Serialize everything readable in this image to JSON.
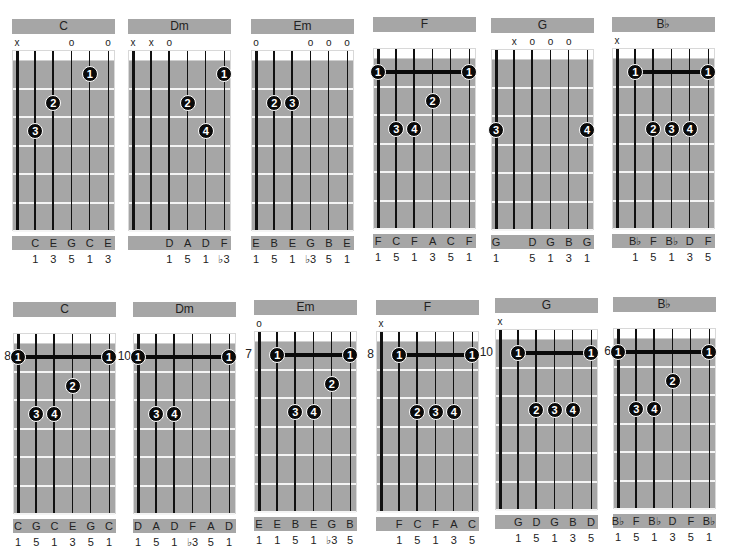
{
  "colors": {
    "panel": "#a6a6a6",
    "dot": "#0a0a0a",
    "fret": "#f4f4f4",
    "nut": "#ffffff"
  },
  "rows": [
    {
      "charts": [
        {
          "name": "C",
          "x": 12,
          "y": 19,
          "start_fret": null,
          "markers": [
            "x",
            "",
            "",
            "o",
            "",
            "o"
          ],
          "dots": [
            {
              "string": 4,
              "fret": 1,
              "finger": "1"
            },
            {
              "string": 2,
              "fret": 2,
              "finger": "2"
            },
            {
              "string": 1,
              "fret": 3,
              "finger": "3"
            }
          ],
          "barre": null,
          "notes": [
            "",
            "C",
            "E",
            "G",
            "C",
            "E"
          ],
          "intervals": [
            "",
            "1",
            "3",
            "5",
            "1",
            "3"
          ]
        },
        {
          "name": "Dm",
          "x": 128,
          "y": 19,
          "start_fret": null,
          "markers": [
            "x",
            "x",
            "o",
            "",
            "",
            ""
          ],
          "dots": [
            {
              "string": 5,
              "fret": 1,
              "finger": "1"
            },
            {
              "string": 3,
              "fret": 2,
              "finger": "2"
            },
            {
              "string": 4,
              "fret": 3,
              "finger": "4"
            }
          ],
          "barre": null,
          "notes": [
            "",
            "",
            "D",
            "A",
            "D",
            "F"
          ],
          "intervals": [
            "",
            "",
            "1",
            "5",
            "1",
            "♭3"
          ]
        },
        {
          "name": "Em",
          "x": 251,
          "y": 19,
          "start_fret": null,
          "markers": [
            "o",
            "",
            "",
            "o",
            "o",
            "o"
          ],
          "dots": [
            {
              "string": 1,
              "fret": 2,
              "finger": "2"
            },
            {
              "string": 2,
              "fret": 2,
              "finger": "3"
            }
          ],
          "barre": null,
          "notes": [
            "E",
            "B",
            "E",
            "G",
            "B",
            "E"
          ],
          "intervals": [
            "1",
            "5",
            "1",
            "♭3",
            "5",
            "1"
          ]
        },
        {
          "name": "F",
          "x": 373,
          "y": 17,
          "start_fret": null,
          "markers": [
            "",
            "",
            "",
            "",
            "",
            ""
          ],
          "dots": [
            {
              "string": 0,
              "fret": 1,
              "finger": "1"
            },
            {
              "string": 5,
              "fret": 1,
              "finger": "1"
            },
            {
              "string": 3,
              "fret": 2,
              "finger": "2"
            },
            {
              "string": 1,
              "fret": 3,
              "finger": "3"
            },
            {
              "string": 2,
              "fret": 3,
              "finger": "4"
            }
          ],
          "barre": {
            "from": 0,
            "to": 5,
            "fret": 1
          },
          "notes": [
            "F",
            "C",
            "F",
            "A",
            "C",
            "F"
          ],
          "intervals": [
            "1",
            "5",
            "1",
            "3",
            "5",
            "1"
          ]
        },
        {
          "name": "G",
          "x": 491,
          "y": 18,
          "start_fret": null,
          "markers": [
            "",
            "x",
            "o",
            "o",
            "o",
            ""
          ],
          "dots": [
            {
              "string": 0,
              "fret": 3,
              "finger": "3"
            },
            {
              "string": 5,
              "fret": 3,
              "finger": "4"
            }
          ],
          "barre": null,
          "notes": [
            "G",
            "",
            "D",
            "G",
            "B",
            "G"
          ],
          "intervals": [
            "1",
            "",
            "5",
            "1",
            "3",
            "1"
          ]
        },
        {
          "name": "B♭",
          "x": 612,
          "y": 17,
          "start_fret": null,
          "markers": [
            "x",
            "",
            "",
            "",
            "",
            ""
          ],
          "dots": [
            {
              "string": 1,
              "fret": 1,
              "finger": "1"
            },
            {
              "string": 5,
              "fret": 1,
              "finger": "1"
            },
            {
              "string": 2,
              "fret": 3,
              "finger": "2"
            },
            {
              "string": 3,
              "fret": 3,
              "finger": "3"
            },
            {
              "string": 4,
              "fret": 3,
              "finger": "4"
            }
          ],
          "barre": {
            "from": 1,
            "to": 5,
            "fret": 1
          },
          "notes": [
            "",
            "B♭",
            "F",
            "B♭",
            "D",
            "F"
          ],
          "intervals": [
            "",
            "1",
            "5",
            "1",
            "3",
            "5"
          ]
        }
      ]
    },
    {
      "charts": [
        {
          "name": "C",
          "x": 13,
          "y": 302,
          "start_fret": "8",
          "markers": [
            "",
            "",
            "",
            "",
            "",
            ""
          ],
          "dots": [
            {
              "string": 0,
              "fret": 1,
              "finger": "1"
            },
            {
              "string": 5,
              "fret": 1,
              "finger": "1"
            },
            {
              "string": 3,
              "fret": 2,
              "finger": "2"
            },
            {
              "string": 1,
              "fret": 3,
              "finger": "3"
            },
            {
              "string": 2,
              "fret": 3,
              "finger": "4"
            }
          ],
          "barre": {
            "from": 0,
            "to": 5,
            "fret": 1
          },
          "notes": [
            "C",
            "G",
            "C",
            "E",
            "G",
            "C"
          ],
          "intervals": [
            "1",
            "5",
            "1",
            "3",
            "5",
            "1"
          ]
        },
        {
          "name": "Dm",
          "x": 133,
          "y": 302,
          "start_fret": "10",
          "markers": [
            "",
            "",
            "",
            "",
            "",
            ""
          ],
          "dots": [
            {
              "string": 0,
              "fret": 1,
              "finger": "1"
            },
            {
              "string": 5,
              "fret": 1,
              "finger": "1"
            },
            {
              "string": 1,
              "fret": 3,
              "finger": "3"
            },
            {
              "string": 2,
              "fret": 3,
              "finger": "4"
            }
          ],
          "barre": {
            "from": 0,
            "to": 5,
            "fret": 1
          },
          "notes": [
            "D",
            "A",
            "D",
            "F",
            "A",
            "D"
          ],
          "intervals": [
            "1",
            "5",
            "1",
            "♭3",
            "5",
            "1"
          ]
        },
        {
          "name": "Em",
          "x": 254,
          "y": 300,
          "start_fret": "7",
          "markers": [
            "o",
            "",
            "",
            "",
            "",
            ""
          ],
          "dots": [
            {
              "string": 1,
              "fret": 1,
              "finger": "1"
            },
            {
              "string": 5,
              "fret": 1,
              "finger": "1"
            },
            {
              "string": 4,
              "fret": 2,
              "finger": "2"
            },
            {
              "string": 2,
              "fret": 3,
              "finger": "3"
            },
            {
              "string": 3,
              "fret": 3,
              "finger": "4"
            }
          ],
          "barre": {
            "from": 1,
            "to": 5,
            "fret": 1
          },
          "notes": [
            "E",
            "E",
            "B",
            "E",
            "G",
            "B"
          ],
          "intervals": [
            "1",
            "1",
            "5",
            "1",
            "♭3",
            "5"
          ]
        },
        {
          "name": "F",
          "x": 376,
          "y": 300,
          "start_fret": "8",
          "markers": [
            "x",
            "",
            "",
            "",
            "",
            ""
          ],
          "dots": [
            {
              "string": 1,
              "fret": 1,
              "finger": "1"
            },
            {
              "string": 5,
              "fret": 1,
              "finger": "1"
            },
            {
              "string": 2,
              "fret": 3,
              "finger": "2"
            },
            {
              "string": 3,
              "fret": 3,
              "finger": "3"
            },
            {
              "string": 4,
              "fret": 3,
              "finger": "4"
            }
          ],
          "barre": {
            "from": 1,
            "to": 5,
            "fret": 1
          },
          "notes": [
            "",
            "F",
            "C",
            "F",
            "A",
            "C"
          ],
          "intervals": [
            "",
            "1",
            "5",
            "1",
            "3",
            "5"
          ]
        },
        {
          "name": "G",
          "x": 495,
          "y": 298,
          "start_fret": "10",
          "markers": [
            "x",
            "",
            "",
            "",
            "",
            ""
          ],
          "dots": [
            {
              "string": 1,
              "fret": 1,
              "finger": "1"
            },
            {
              "string": 5,
              "fret": 1,
              "finger": "1"
            },
            {
              "string": 2,
              "fret": 3,
              "finger": "2"
            },
            {
              "string": 3,
              "fret": 3,
              "finger": "3"
            },
            {
              "string": 4,
              "fret": 3,
              "finger": "4"
            }
          ],
          "barre": {
            "from": 1,
            "to": 5,
            "fret": 1
          },
          "notes": [
            "",
            "G",
            "D",
            "G",
            "B",
            "D"
          ],
          "intervals": [
            "",
            "1",
            "5",
            "1",
            "3",
            "5"
          ]
        },
        {
          "name": "B♭",
          "x": 613,
          "y": 297,
          "start_fret": "6",
          "markers": [
            "",
            "",
            "",
            "",
            "",
            ""
          ],
          "dots": [
            {
              "string": 0,
              "fret": 1,
              "finger": "1"
            },
            {
              "string": 5,
              "fret": 1,
              "finger": "1"
            },
            {
              "string": 3,
              "fret": 2,
              "finger": "2"
            },
            {
              "string": 1,
              "fret": 3,
              "finger": "3"
            },
            {
              "string": 2,
              "fret": 3,
              "finger": "4"
            }
          ],
          "barre": {
            "from": 0,
            "to": 5,
            "fret": 1
          },
          "notes": [
            "B♭",
            "F",
            "B♭",
            "D",
            "F",
            "B♭"
          ],
          "intervals": [
            "1",
            "5",
            "1",
            "3",
            "5",
            "1"
          ]
        }
      ]
    }
  ]
}
